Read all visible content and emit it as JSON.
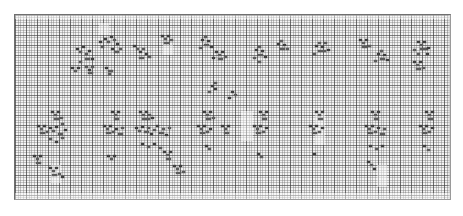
{
  "window": {
    "app": "spreadsheet",
    "view_label": "Zoomed-out worksheet",
    "zoom_level": "10%"
  },
  "sheet": {
    "name": "Sheet1",
    "grid_visible": true,
    "gridline_color": "#6e6e6e",
    "background_color": "#f3f3f3",
    "mark_color": "#5c5c5c",
    "cell_width_px": 2.75,
    "cell_height_px": 2.5,
    "major_col_every": 4,
    "major_row_every": 4,
    "columns_visible": 158,
    "rows_visible": 74
  },
  "scrollbar": {
    "orientation": "vertical",
    "position": "right"
  },
  "washes": [
    {
      "x": 0,
      "y": 0,
      "w": 437,
      "h": 4
    },
    {
      "x": 84,
      "y": 8,
      "w": 10,
      "h": 12
    },
    {
      "x": 148,
      "y": 30,
      "w": 10,
      "h": 10
    },
    {
      "x": 226,
      "y": 96,
      "w": 12,
      "h": 30
    },
    {
      "x": 300,
      "y": 96,
      "w": 10,
      "h": 34
    },
    {
      "x": 36,
      "y": 150,
      "w": 10,
      "h": 18
    },
    {
      "x": 362,
      "y": 150,
      "w": 10,
      "h": 22
    },
    {
      "x": 0,
      "y": 178,
      "w": 437,
      "h": 8
    }
  ],
  "marks": [
    {
      "x": 84,
      "y": 26,
      "k": "d"
    },
    {
      "x": 89,
      "y": 23,
      "k": "d"
    },
    {
      "x": 92,
      "y": 26,
      "k": ""
    },
    {
      "x": 95,
      "y": 21,
      "k": "d"
    },
    {
      "x": 98,
      "y": 24,
      "k": ""
    },
    {
      "x": 101,
      "y": 28,
      "k": "d"
    },
    {
      "x": 86,
      "y": 31,
      "k": ""
    },
    {
      "x": 96,
      "y": 33,
      "k": "d"
    },
    {
      "x": 99,
      "y": 36,
      "k": "w"
    },
    {
      "x": 104,
      "y": 33,
      "k": ""
    },
    {
      "x": 61,
      "y": 33,
      "k": "d"
    },
    {
      "x": 64,
      "y": 36,
      "k": ""
    },
    {
      "x": 67,
      "y": 31,
      "k": "d"
    },
    {
      "x": 70,
      "y": 38,
      "k": ""
    },
    {
      "x": 73,
      "y": 35,
      "k": "d"
    },
    {
      "x": 70,
      "y": 43,
      "k": "w"
    },
    {
      "x": 64,
      "y": 46,
      "k": ""
    },
    {
      "x": 76,
      "y": 43,
      "k": "d"
    },
    {
      "x": 56,
      "y": 52,
      "k": "d"
    },
    {
      "x": 59,
      "y": 55,
      "k": ""
    },
    {
      "x": 62,
      "y": 52,
      "k": "d"
    },
    {
      "x": 70,
      "y": 51,
      "k": ""
    },
    {
      "x": 73,
      "y": 54,
      "k": "d"
    },
    {
      "x": 76,
      "y": 51,
      "k": ""
    },
    {
      "x": 73,
      "y": 57,
      "k": "w"
    },
    {
      "x": 90,
      "y": 52,
      "k": "d"
    },
    {
      "x": 93,
      "y": 55,
      "k": "w"
    },
    {
      "x": 93,
      "y": 58,
      "k": ""
    },
    {
      "x": 118,
      "y": 30,
      "k": "d"
    },
    {
      "x": 121,
      "y": 33,
      "k": ""
    },
    {
      "x": 124,
      "y": 36,
      "k": "d"
    },
    {
      "x": 127,
      "y": 33,
      "k": ""
    },
    {
      "x": 130,
      "y": 38,
      "k": "d"
    },
    {
      "x": 124,
      "y": 42,
      "k": "w"
    },
    {
      "x": 133,
      "y": 41,
      "k": ""
    },
    {
      "x": 146,
      "y": 20,
      "k": "d"
    },
    {
      "x": 149,
      "y": 23,
      "k": ""
    },
    {
      "x": 152,
      "y": 20,
      "k": "d"
    },
    {
      "x": 149,
      "y": 27,
      "k": "w"
    },
    {
      "x": 155,
      "y": 24,
      "k": ""
    },
    {
      "x": 186,
      "y": 24,
      "k": "d"
    },
    {
      "x": 189,
      "y": 21,
      "k": ""
    },
    {
      "x": 192,
      "y": 25,
      "k": "d"
    },
    {
      "x": 189,
      "y": 29,
      "k": "w"
    },
    {
      "x": 184,
      "y": 32,
      "k": ""
    },
    {
      "x": 195,
      "y": 31,
      "k": "d"
    },
    {
      "x": 200,
      "y": 36,
      "k": "d"
    },
    {
      "x": 203,
      "y": 39,
      "k": ""
    },
    {
      "x": 206,
      "y": 36,
      "k": "d"
    },
    {
      "x": 203,
      "y": 43,
      "k": "w"
    },
    {
      "x": 209,
      "y": 41,
      "k": ""
    },
    {
      "x": 197,
      "y": 42,
      "k": "d"
    },
    {
      "x": 240,
      "y": 34,
      "k": "d"
    },
    {
      "x": 243,
      "y": 31,
      "k": ""
    },
    {
      "x": 246,
      "y": 35,
      "k": "d"
    },
    {
      "x": 243,
      "y": 39,
      "k": "w"
    },
    {
      "x": 238,
      "y": 42,
      "k": ""
    },
    {
      "x": 249,
      "y": 41,
      "k": "d"
    },
    {
      "x": 243,
      "y": 46,
      "k": ""
    },
    {
      "x": 262,
      "y": 28,
      "k": "d"
    },
    {
      "x": 265,
      "y": 25,
      "k": ""
    },
    {
      "x": 268,
      "y": 29,
      "k": "d"
    },
    {
      "x": 265,
      "y": 33,
      "k": "w"
    },
    {
      "x": 271,
      "y": 33,
      "k": ""
    },
    {
      "x": 300,
      "y": 30,
      "k": "d"
    },
    {
      "x": 303,
      "y": 27,
      "k": ""
    },
    {
      "x": 306,
      "y": 31,
      "k": "d"
    },
    {
      "x": 309,
      "y": 27,
      "k": ""
    },
    {
      "x": 303,
      "y": 35,
      "k": "w3"
    },
    {
      "x": 312,
      "y": 34,
      "k": "d"
    },
    {
      "x": 298,
      "y": 38,
      "k": ""
    },
    {
      "x": 344,
      "y": 24,
      "k": "d"
    },
    {
      "x": 347,
      "y": 27,
      "k": ""
    },
    {
      "x": 350,
      "y": 24,
      "k": "d"
    },
    {
      "x": 347,
      "y": 31,
      "k": "w"
    },
    {
      "x": 353,
      "y": 30,
      "k": ""
    },
    {
      "x": 362,
      "y": 38,
      "k": "d"
    },
    {
      "x": 365,
      "y": 35,
      "k": ""
    },
    {
      "x": 368,
      "y": 39,
      "k": "d"
    },
    {
      "x": 365,
      "y": 43,
      "k": "w"
    },
    {
      "x": 359,
      "y": 45,
      "k": ""
    },
    {
      "x": 371,
      "y": 44,
      "k": "d"
    },
    {
      "x": 402,
      "y": 26,
      "k": "d"
    },
    {
      "x": 405,
      "y": 29,
      "k": ""
    },
    {
      "x": 408,
      "y": 26,
      "k": "d"
    },
    {
      "x": 398,
      "y": 34,
      "k": ""
    },
    {
      "x": 405,
      "y": 33,
      "k": "w3"
    },
    {
      "x": 412,
      "y": 32,
      "k": "d"
    },
    {
      "x": 402,
      "y": 38,
      "k": ""
    },
    {
      "x": 411,
      "y": 38,
      "k": "d"
    },
    {
      "x": 398,
      "y": 46,
      "k": "d"
    },
    {
      "x": 401,
      "y": 49,
      "k": ""
    },
    {
      "x": 404,
      "y": 46,
      "k": "d"
    },
    {
      "x": 401,
      "y": 53,
      "k": "w"
    },
    {
      "x": 407,
      "y": 52,
      "k": ""
    },
    {
      "x": 196,
      "y": 70,
      "k": "d"
    },
    {
      "x": 199,
      "y": 67,
      "k": ""
    },
    {
      "x": 199,
      "y": 73,
      "k": "d"
    },
    {
      "x": 193,
      "y": 76,
      "k": ""
    },
    {
      "x": 216,
      "y": 76,
      "k": "d"
    },
    {
      "x": 219,
      "y": 79,
      "k": ""
    },
    {
      "x": 213,
      "y": 82,
      "k": "d"
    },
    {
      "x": 36,
      "y": 96,
      "k": "d"
    },
    {
      "x": 39,
      "y": 99,
      "k": ""
    },
    {
      "x": 42,
      "y": 96,
      "k": "d"
    },
    {
      "x": 39,
      "y": 103,
      "k": "w"
    },
    {
      "x": 45,
      "y": 102,
      "k": ""
    },
    {
      "x": 22,
      "y": 110,
      "k": "d"
    },
    {
      "x": 25,
      "y": 113,
      "k": ""
    },
    {
      "x": 28,
      "y": 110,
      "k": "d"
    },
    {
      "x": 25,
      "y": 117,
      "k": "w"
    },
    {
      "x": 31,
      "y": 116,
      "k": ""
    },
    {
      "x": 34,
      "y": 112,
      "k": "d"
    },
    {
      "x": 37,
      "y": 115,
      "k": ""
    },
    {
      "x": 40,
      "y": 111,
      "k": "d"
    },
    {
      "x": 43,
      "y": 118,
      "k": "w"
    },
    {
      "x": 46,
      "y": 108,
      "k": ""
    },
    {
      "x": 49,
      "y": 114,
      "k": "d"
    },
    {
      "x": 34,
      "y": 123,
      "k": ""
    },
    {
      "x": 40,
      "y": 126,
      "k": "d"
    },
    {
      "x": 46,
      "y": 122,
      "k": ""
    },
    {
      "x": 18,
      "y": 140,
      "k": "d"
    },
    {
      "x": 21,
      "y": 143,
      "k": ""
    },
    {
      "x": 24,
      "y": 140,
      "k": "d"
    },
    {
      "x": 21,
      "y": 147,
      "k": "w"
    },
    {
      "x": 34,
      "y": 152,
      "k": "d"
    },
    {
      "x": 37,
      "y": 155,
      "k": ""
    },
    {
      "x": 40,
      "y": 152,
      "k": "d"
    },
    {
      "x": 37,
      "y": 159,
      "k": "w"
    },
    {
      "x": 43,
      "y": 158,
      "k": ""
    },
    {
      "x": 46,
      "y": 161,
      "k": "d"
    },
    {
      "x": 96,
      "y": 96,
      "k": "d"
    },
    {
      "x": 99,
      "y": 99,
      "k": ""
    },
    {
      "x": 102,
      "y": 96,
      "k": "d"
    },
    {
      "x": 99,
      "y": 103,
      "k": "w"
    },
    {
      "x": 88,
      "y": 110,
      "k": "d"
    },
    {
      "x": 91,
      "y": 113,
      "k": ""
    },
    {
      "x": 94,
      "y": 110,
      "k": "d"
    },
    {
      "x": 91,
      "y": 117,
      "k": "w"
    },
    {
      "x": 97,
      "y": 116,
      "k": ""
    },
    {
      "x": 100,
      "y": 113,
      "k": "d"
    },
    {
      "x": 103,
      "y": 118,
      "k": "w"
    },
    {
      "x": 106,
      "y": 112,
      "k": ""
    },
    {
      "x": 92,
      "y": 140,
      "k": "d"
    },
    {
      "x": 95,
      "y": 143,
      "k": ""
    },
    {
      "x": 98,
      "y": 140,
      "k": "d"
    },
    {
      "x": 124,
      "y": 96,
      "k": "d"
    },
    {
      "x": 127,
      "y": 99,
      "k": ""
    },
    {
      "x": 130,
      "y": 96,
      "k": "d"
    },
    {
      "x": 133,
      "y": 99,
      "k": ""
    },
    {
      "x": 127,
      "y": 103,
      "k": "w3"
    },
    {
      "x": 136,
      "y": 102,
      "k": "d"
    },
    {
      "x": 120,
      "y": 112,
      "k": "d"
    },
    {
      "x": 123,
      "y": 115,
      "k": ""
    },
    {
      "x": 126,
      "y": 111,
      "k": "d"
    },
    {
      "x": 129,
      "y": 116,
      "k": "w"
    },
    {
      "x": 132,
      "y": 112,
      "k": ""
    },
    {
      "x": 135,
      "y": 118,
      "k": "d"
    },
    {
      "x": 138,
      "y": 114,
      "k": ""
    },
    {
      "x": 141,
      "y": 110,
      "k": "d"
    },
    {
      "x": 144,
      "y": 117,
      "k": "w"
    },
    {
      "x": 147,
      "y": 113,
      "k": ""
    },
    {
      "x": 150,
      "y": 119,
      "k": "d"
    },
    {
      "x": 153,
      "y": 112,
      "k": ""
    },
    {
      "x": 126,
      "y": 128,
      "k": "d"
    },
    {
      "x": 132,
      "y": 131,
      "k": ""
    },
    {
      "x": 138,
      "y": 128,
      "k": "d"
    },
    {
      "x": 144,
      "y": 132,
      "k": ""
    },
    {
      "x": 148,
      "y": 136,
      "k": "d"
    },
    {
      "x": 151,
      "y": 139,
      "k": ""
    },
    {
      "x": 154,
      "y": 136,
      "k": "d"
    },
    {
      "x": 151,
      "y": 143,
      "k": "w"
    },
    {
      "x": 158,
      "y": 150,
      "k": "d"
    },
    {
      "x": 161,
      "y": 153,
      "k": ""
    },
    {
      "x": 164,
      "y": 150,
      "k": "d"
    },
    {
      "x": 161,
      "y": 157,
      "k": "w"
    },
    {
      "x": 167,
      "y": 156,
      "k": ""
    },
    {
      "x": 188,
      "y": 96,
      "k": "d"
    },
    {
      "x": 191,
      "y": 99,
      "k": ""
    },
    {
      "x": 194,
      "y": 96,
      "k": "d"
    },
    {
      "x": 191,
      "y": 103,
      "k": "w"
    },
    {
      "x": 197,
      "y": 102,
      "k": ""
    },
    {
      "x": 182,
      "y": 110,
      "k": "d"
    },
    {
      "x": 185,
      "y": 113,
      "k": ""
    },
    {
      "x": 188,
      "y": 110,
      "k": "d"
    },
    {
      "x": 185,
      "y": 117,
      "k": "w"
    },
    {
      "x": 191,
      "y": 116,
      "k": ""
    },
    {
      "x": 194,
      "y": 113,
      "k": "d"
    },
    {
      "x": 190,
      "y": 130,
      "k": "d"
    },
    {
      "x": 193,
      "y": 133,
      "k": ""
    },
    {
      "x": 206,
      "y": 110,
      "k": "d"
    },
    {
      "x": 209,
      "y": 113,
      "k": ""
    },
    {
      "x": 212,
      "y": 110,
      "k": "d"
    },
    {
      "x": 209,
      "y": 117,
      "k": "w"
    },
    {
      "x": 244,
      "y": 96,
      "k": "d"
    },
    {
      "x": 247,
      "y": 99,
      "k": ""
    },
    {
      "x": 250,
      "y": 96,
      "k": "d"
    },
    {
      "x": 247,
      "y": 103,
      "k": "w"
    },
    {
      "x": 238,
      "y": 110,
      "k": "d"
    },
    {
      "x": 241,
      "y": 113,
      "k": ""
    },
    {
      "x": 244,
      "y": 110,
      "k": "d"
    },
    {
      "x": 241,
      "y": 117,
      "k": "w"
    },
    {
      "x": 247,
      "y": 116,
      "k": ""
    },
    {
      "x": 250,
      "y": 112,
      "k": "d"
    },
    {
      "x": 242,
      "y": 138,
      "k": "d"
    },
    {
      "x": 245,
      "y": 141,
      "k": ""
    },
    {
      "x": 300,
      "y": 96,
      "k": "d"
    },
    {
      "x": 303,
      "y": 99,
      "k": ""
    },
    {
      "x": 306,
      "y": 96,
      "k": "d"
    },
    {
      "x": 303,
      "y": 103,
      "k": "w"
    },
    {
      "x": 294,
      "y": 110,
      "k": "d"
    },
    {
      "x": 297,
      "y": 113,
      "k": ""
    },
    {
      "x": 300,
      "y": 110,
      "k": "d"
    },
    {
      "x": 297,
      "y": 117,
      "k": "w"
    },
    {
      "x": 303,
      "y": 116,
      "k": ""
    },
    {
      "x": 306,
      "y": 112,
      "k": "d"
    },
    {
      "x": 298,
      "y": 138,
      "k": "d"
    },
    {
      "x": 356,
      "y": 96,
      "k": "d"
    },
    {
      "x": 359,
      "y": 99,
      "k": ""
    },
    {
      "x": 362,
      "y": 96,
      "k": "d"
    },
    {
      "x": 359,
      "y": 103,
      "k": "w"
    },
    {
      "x": 350,
      "y": 110,
      "k": "d"
    },
    {
      "x": 353,
      "y": 113,
      "k": ""
    },
    {
      "x": 356,
      "y": 110,
      "k": "d"
    },
    {
      "x": 353,
      "y": 117,
      "k": "w"
    },
    {
      "x": 359,
      "y": 116,
      "k": ""
    },
    {
      "x": 362,
      "y": 112,
      "k": "d"
    },
    {
      "x": 365,
      "y": 118,
      "k": "w"
    },
    {
      "x": 368,
      "y": 113,
      "k": ""
    },
    {
      "x": 354,
      "y": 130,
      "k": "d"
    },
    {
      "x": 360,
      "y": 133,
      "k": ""
    },
    {
      "x": 366,
      "y": 130,
      "k": "d"
    },
    {
      "x": 352,
      "y": 146,
      "k": "d"
    },
    {
      "x": 355,
      "y": 149,
      "k": ""
    },
    {
      "x": 358,
      "y": 153,
      "k": "d"
    },
    {
      "x": 410,
      "y": 96,
      "k": "d"
    },
    {
      "x": 413,
      "y": 99,
      "k": ""
    },
    {
      "x": 416,
      "y": 96,
      "k": "d"
    },
    {
      "x": 413,
      "y": 103,
      "k": "w"
    },
    {
      "x": 404,
      "y": 110,
      "k": "d"
    },
    {
      "x": 407,
      "y": 113,
      "k": ""
    },
    {
      "x": 410,
      "y": 110,
      "k": "d"
    },
    {
      "x": 407,
      "y": 117,
      "k": "w"
    },
    {
      "x": 413,
      "y": 116,
      "k": ""
    },
    {
      "x": 416,
      "y": 112,
      "k": "d"
    },
    {
      "x": 408,
      "y": 130,
      "k": "d"
    },
    {
      "x": 412,
      "y": 134,
      "k": ""
    }
  ]
}
